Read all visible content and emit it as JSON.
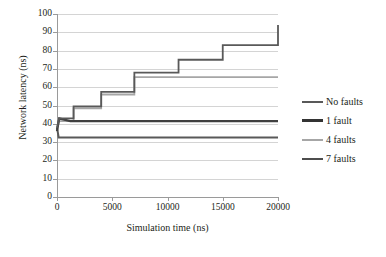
{
  "chart_data": {
    "type": "line",
    "title": "",
    "xlabel": "Simulation time (ns)",
    "ylabel": "Network latency (ns)",
    "xlim": [
      0,
      20000
    ],
    "ylim": [
      0,
      100
    ],
    "xticks": [
      0,
      5000,
      10000,
      15000,
      20000
    ],
    "yticks": [
      0,
      10,
      20,
      30,
      40,
      50,
      60,
      70,
      80,
      90,
      100
    ],
    "xtick_labels": [
      "0",
      "5000",
      "10000",
      "15000",
      "20000"
    ],
    "ytick_labels": [
      "0",
      "10",
      "20",
      "30",
      "40",
      "50",
      "60",
      "70",
      "80",
      "90",
      "100"
    ],
    "grid": "horizontal",
    "legend_position": "right",
    "series": [
      {
        "name": "No faults",
        "color": "#595959",
        "width": 1.8,
        "x": [
          0,
          200,
          1500,
          1500,
          4000,
          4000,
          7000,
          7000,
          11000,
          11000,
          15000,
          15000,
          20000,
          20000
        ],
        "y": [
          38,
          43,
          43,
          49.5,
          49.5,
          57.5,
          57.5,
          68,
          68,
          75,
          75,
          83,
          83,
          94
        ]
      },
      {
        "name": "1 fault",
        "color": "#404040",
        "width": 2.2,
        "x": [
          0,
          200,
          1200,
          20000
        ],
        "y": [
          36,
          43,
          41.5,
          41.5
        ]
      },
      {
        "name": "4 faults",
        "color": "#a6a6a6",
        "width": 1.8,
        "x": [
          0,
          200,
          1500,
          1500,
          4000,
          4000,
          7000,
          7000,
          20000
        ],
        "y": [
          37,
          41.5,
          41.5,
          48.5,
          48.5,
          56,
          56,
          65.5,
          65.5
        ]
      },
      {
        "name": "7 faults",
        "color": "#595959",
        "width": 2.0,
        "x": [
          0,
          150,
          20000
        ],
        "y": [
          38,
          32.5,
          32.5
        ]
      }
    ],
    "legend_entries": [
      {
        "label": "No faults",
        "color": "#595959",
        "width": 2
      },
      {
        "label": "1 fault",
        "color": "#333333",
        "width": 3
      },
      {
        "label": "4 faults",
        "color": "#a6a6a6",
        "width": 2
      },
      {
        "label": "7 faults",
        "color": "#4d4d4d",
        "width": 2.5
      }
    ]
  }
}
